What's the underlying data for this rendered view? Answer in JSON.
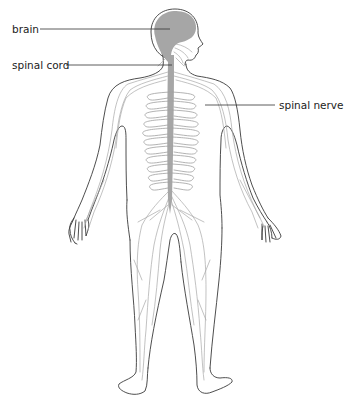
{
  "diagram": {
    "labels": [
      {
        "id": "brain",
        "text": "brain",
        "side": "left"
      },
      {
        "id": "spinal_cord",
        "text": "spinal cord",
        "side": "left"
      },
      {
        "id": "spinal_nerve",
        "text": "spinal nerve",
        "side": "right"
      }
    ]
  },
  "colors": {
    "background": "#ffffff",
    "outline": "#3a3a3a",
    "brain_and_cord": "#a6a6a6",
    "nerves": "#a8a8a8",
    "label_text": "#222222"
  }
}
